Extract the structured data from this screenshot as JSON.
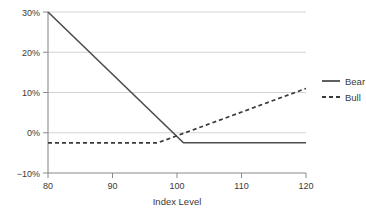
{
  "chart_data": {
    "type": "line",
    "title": "",
    "subtitle": "",
    "xlabel": "Index Level",
    "ylabel": "",
    "xlim": [
      80,
      120
    ],
    "ylim": [
      -10,
      30
    ],
    "grid": true,
    "legend_position": "right",
    "x_ticks": [
      80,
      90,
      100,
      110,
      120
    ],
    "x_tick_labels": [
      "80",
      "90",
      "100",
      "110",
      "120"
    ],
    "y_ticks": [
      -10,
      0,
      10,
      20,
      30
    ],
    "y_tick_labels": [
      "−10%",
      "0%",
      "10%",
      "20%",
      "30%"
    ],
    "series": [
      {
        "name": "Bear",
        "style": "solid",
        "color": "#4d4d4d",
        "x": [
          80,
          101,
          120
        ],
        "values": [
          30,
          -2.5,
          -2.5
        ]
      },
      {
        "name": "Bull",
        "style": "dashed",
        "color": "#3a3a3a",
        "x": [
          80,
          97,
          120
        ],
        "values": [
          -2.5,
          -2.5,
          11
        ]
      }
    ]
  },
  "legend": {
    "entries": [
      {
        "label": "Bear",
        "style": "solid"
      },
      {
        "label": "Bull",
        "style": "dashed"
      }
    ]
  },
  "axes": {
    "x_title": "Index Level"
  }
}
